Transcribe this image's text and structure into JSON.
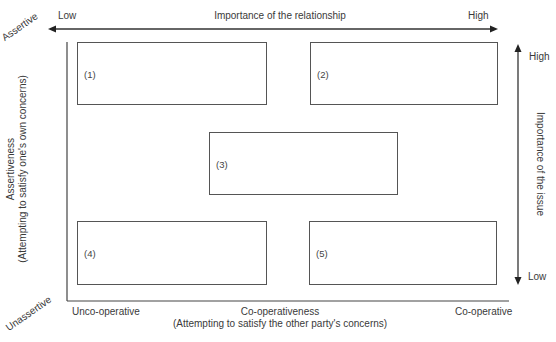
{
  "diagram": {
    "type": "conflict-handling-grid",
    "top_axis": {
      "title": "Importance of the relationship",
      "low_label": "Low",
      "high_label": "High"
    },
    "right_axis": {
      "title": "Importance of the issue",
      "high_label": "High",
      "low_label": "Low"
    },
    "left_axis": {
      "title": "Assertiveness",
      "subtitle": "(Attempting to satisfy one's own concerns)",
      "top_label": "Assertive",
      "bottom_label": "Unassertive"
    },
    "bottom_axis": {
      "title": "Co-operativeness",
      "subtitle": "(Attempting to satisfy the other party's concerns)",
      "left_label": "Unco-operative",
      "right_label": "Co-operative"
    },
    "boxes": [
      {
        "id": "1",
        "label": "(1)",
        "position": "top-left"
      },
      {
        "id": "2",
        "label": "(2)",
        "position": "top-right"
      },
      {
        "id": "3",
        "label": "(3)",
        "position": "center"
      },
      {
        "id": "4",
        "label": "(4)",
        "position": "bottom-left"
      },
      {
        "id": "5",
        "label": "(5)",
        "position": "bottom-right"
      }
    ],
    "colors": {
      "line": "#333333",
      "box_border": "#555555",
      "text": "#3a3a3a",
      "background": "#ffffff"
    }
  }
}
